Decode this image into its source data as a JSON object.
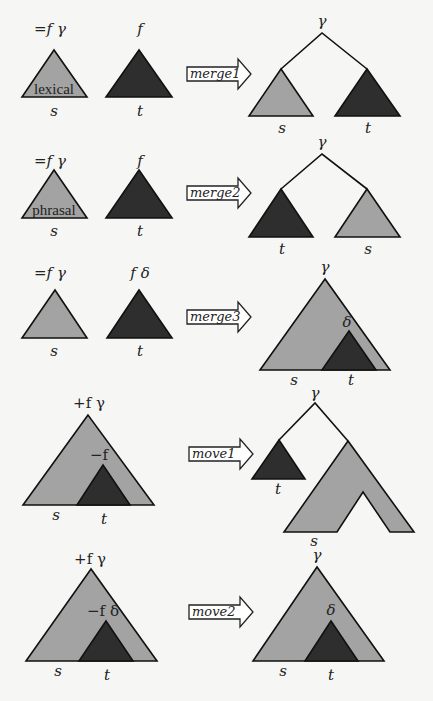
{
  "diagram": {
    "colors": {
      "head_tree": "#a3a3a3",
      "argument_tree": "#2e2e2e",
      "outline": "#111111",
      "background": "#f6f6f4"
    },
    "rows": [
      {
        "operation": "merge1",
        "left": {
          "s_features": "=f γ",
          "s_type": "lexical",
          "s_label": "s",
          "t_features": "f",
          "t_label": "t"
        },
        "result": {
          "root": "γ",
          "left_label": "s",
          "right_label": "t"
        }
      },
      {
        "operation": "merge2",
        "left": {
          "s_features": "=f γ",
          "s_type": "phrasal",
          "s_label": "s",
          "t_features": "f",
          "t_label": "t"
        },
        "result": {
          "root": "γ",
          "left_label": "t",
          "right_label": "s"
        }
      },
      {
        "operation": "merge3",
        "left": {
          "s_features": "=f γ",
          "s_label": "s",
          "t_features": "f δ",
          "t_label": "t"
        },
        "result": {
          "root": "γ",
          "inner": "δ",
          "left_label": "s",
          "right_label": "t"
        }
      },
      {
        "operation": "move1",
        "left": {
          "root_features": "+f γ",
          "inner_features": "−f",
          "s_label": "s",
          "t_label": "t"
        },
        "result": {
          "root": "γ",
          "left_label": "t",
          "right_label": "s"
        }
      },
      {
        "operation": "move2",
        "left": {
          "root_features": "+f γ",
          "inner_features": "−f δ",
          "s_label": "s",
          "t_label": "t"
        },
        "result": {
          "root": "γ",
          "inner": "δ",
          "left_label": "s",
          "right_label": "t"
        }
      }
    ]
  }
}
